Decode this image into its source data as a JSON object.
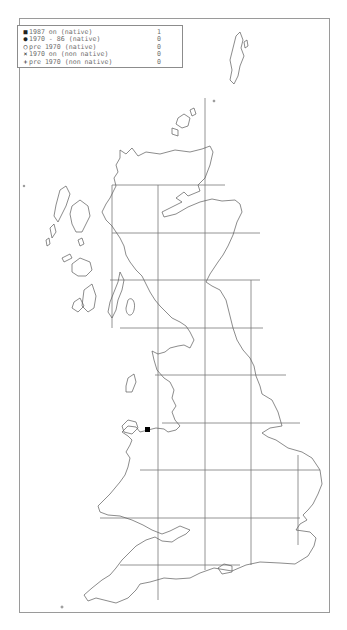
{
  "legend": {
    "rows": [
      {
        "symbol": "■",
        "symbol_name": "filled-square",
        "label": "1987 on (native)",
        "count": "1"
      },
      {
        "symbol": "●",
        "symbol_name": "filled-circle",
        "label": "1970 - 86 (native)",
        "count": "0"
      },
      {
        "symbol": "○",
        "symbol_name": "open-circle",
        "label": "pre 1970 (native)",
        "count": "0"
      },
      {
        "symbol": "×",
        "symbol_name": "cross",
        "label": "1970 on (non native)",
        "count": "0"
      },
      {
        "symbol": "+",
        "symbol_name": "plus",
        "label": "pre 1970 (non native)",
        "count": "0"
      }
    ]
  },
  "map": {
    "region": "Great Britain",
    "grid_spacing_px": 46.5,
    "records": [
      {
        "type": "1987 on (native)",
        "symbol": "filled-square",
        "x": 145,
        "y": 427,
        "location": "North Wales coast"
      }
    ],
    "colors": {
      "coastline": "#5a5a5a",
      "grid": "#7a7a7a",
      "record": "#000000"
    }
  }
}
